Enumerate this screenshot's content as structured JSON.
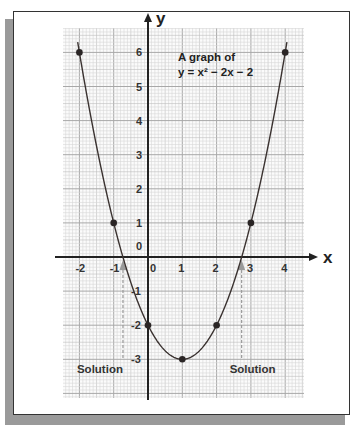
{
  "chart_data": {
    "type": "line",
    "title": "A graph of",
    "subtitle": "y = x² − 2x − 2",
    "function": "y = x^2 - 2x - 2",
    "xlabel": "x",
    "ylabel": "y",
    "xlim": [
      -2.5,
      4.5
    ],
    "ylim": [
      -3.9,
      6.5
    ],
    "grid": true,
    "x_ticks": [
      {
        "value": -2,
        "label": "-2"
      },
      {
        "value": -1,
        "label": "-1"
      },
      {
        "value": 0,
        "label": "0"
      },
      {
        "value": 1,
        "label": "1"
      },
      {
        "value": 2,
        "label": "2"
      },
      {
        "value": 3,
        "label": "3"
      },
      {
        "value": 4,
        "label": "4"
      }
    ],
    "y_ticks": [
      {
        "value": 6,
        "label": "6"
      },
      {
        "value": 5,
        "label": "5"
      },
      {
        "value": 4,
        "label": "4"
      },
      {
        "value": 3,
        "label": "3"
      },
      {
        "value": 2,
        "label": "2"
      },
      {
        "value": 1,
        "label": "1"
      },
      {
        "value": 0,
        "label": "0"
      },
      {
        "value": -1,
        "label": "-1"
      },
      {
        "value": -2,
        "label": "-2"
      },
      {
        "value": -3,
        "label": "-3"
      }
    ],
    "series": [
      {
        "name": "y = x² − 2x − 2",
        "color": "#3a3230",
        "curve_x_range": [
          -2.05,
          4.05
        ],
        "points": [
          {
            "x": -2,
            "y": 6
          },
          {
            "x": -1,
            "y": 1
          },
          {
            "x": 0,
            "y": -2
          },
          {
            "x": 1,
            "y": -3
          },
          {
            "x": 2,
            "y": -2
          },
          {
            "x": 3,
            "y": 1
          },
          {
            "x": 4,
            "y": 6
          }
        ]
      }
    ],
    "annotations": [
      {
        "label": "Solution",
        "x": -0.73,
        "type": "dashed-arrow-to-x-axis"
      },
      {
        "label": "Solution",
        "x": 2.73,
        "type": "dashed-arrow-to-x-axis"
      }
    ]
  },
  "colors": {
    "curve": "#3a3230",
    "grid_minor": "#d6d6d6",
    "grid_major": "#a8a8a8",
    "axis": "#222222",
    "annotation": "#9a9a9a"
  }
}
